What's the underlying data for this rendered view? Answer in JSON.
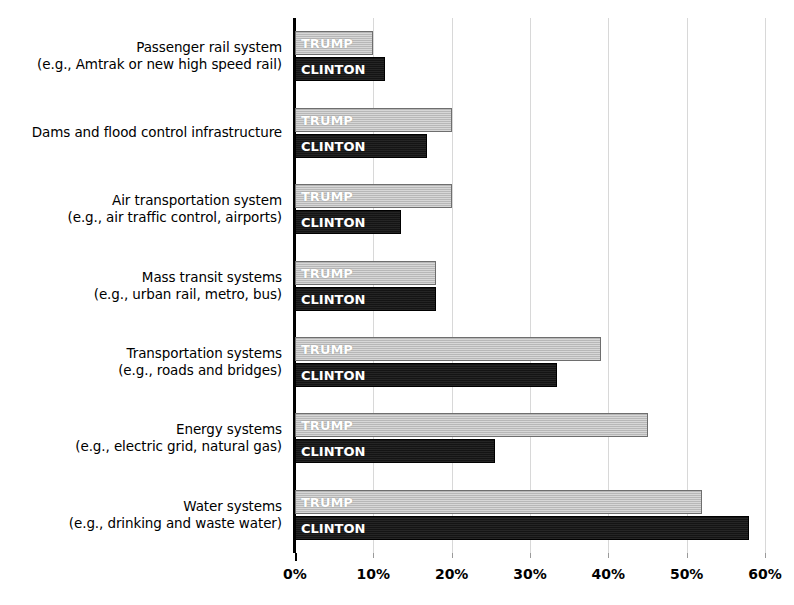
{
  "chart_data": {
    "type": "bar",
    "title": "",
    "orientation": "horizontal",
    "grouped": true,
    "xlabel": "",
    "ylabel": "",
    "xlim": [
      0,
      60
    ],
    "xticks": [
      "0%",
      "10%",
      "20%",
      "30%",
      "40%",
      "50%",
      "60%"
    ],
    "xtick_values": [
      0,
      10,
      20,
      30,
      40,
      50,
      60
    ],
    "grid": true,
    "legend_position": "in-bar",
    "categories": [
      "Passenger rail system (e.g., Amtrak or new high speed rail)",
      "Dams and flood control infrastructure",
      "Air transportation system (e.g., air traffic control, airports)",
      "Mass transit systems (e.g., urban rail, metro, bus)",
      "Transportation systems (e.g., roads and bridges)",
      "Energy systems (e.g., electric grid, natural gas)",
      "Water systems (e.g., drinking and waste water)"
    ],
    "series": [
      {
        "name": "TRUMP",
        "color": "#b7b7b7",
        "values": [
          10.0,
          20.0,
          20.0,
          18.0,
          39.0,
          45.0,
          52.0
        ]
      },
      {
        "name": "CLINTON",
        "color": "#141414",
        "values": [
          11.5,
          16.8,
          13.5,
          18.0,
          33.5,
          25.5,
          58.0
        ]
      }
    ]
  },
  "axis": {
    "x_ticks": [
      {
        "label": "0%",
        "value": 0
      },
      {
        "label": "10%",
        "value": 10
      },
      {
        "label": "20%",
        "value": 20
      },
      {
        "label": "30%",
        "value": 30
      },
      {
        "label": "40%",
        "value": 40
      },
      {
        "label": "50%",
        "value": 50
      },
      {
        "label": "60%",
        "value": 60
      }
    ]
  },
  "category_labels": [
    {
      "line1": "Passenger rail system",
      "line2": "(e.g., Amtrak or new high speed rail)"
    },
    {
      "line1": "Dams and flood control infrastructure",
      "line2": ""
    },
    {
      "line1": "Air transportation system",
      "line2": "(e.g., air traffic control, airports)"
    },
    {
      "line1": "Mass transit systems",
      "line2": "(e.g., urban rail, metro, bus)"
    },
    {
      "line1": "Transportation systems",
      "line2": "(e.g., roads and bridges)"
    },
    {
      "line1": "Energy systems",
      "line2": "(e.g., electric grid, natural gas)"
    },
    {
      "line1": "Water systems",
      "line2": "(e.g., drinking and waste water)"
    }
  ],
  "bar_labels": {
    "trump": "TRUMP",
    "clinton": "CLINTON"
  }
}
